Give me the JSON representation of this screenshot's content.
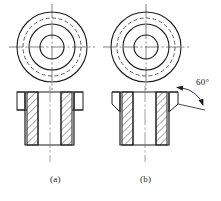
{
  "drawing": {
    "title": "",
    "figure_labels": [
      {
        "id": "a",
        "text": "(a)",
        "x": 50,
        "y": 176
      },
      {
        "id": "b",
        "text": "(b)",
        "x": 140,
        "y": 176
      }
    ],
    "annotations": [
      {
        "id": "chamfer-angle",
        "text": "60°",
        "x": 196,
        "y": 79,
        "belongs_to": "b"
      }
    ],
    "views": [
      {
        "id": "a",
        "top_view": {
          "center": {
            "cx": 52,
            "cy": 47
          },
          "circles": [
            {
              "name": "outer-circle",
              "r": 35,
              "style": "solid"
            },
            {
              "name": "dashed-circle",
              "r": 29,
              "style": "dashed"
            },
            {
              "name": "middle-circle",
              "r": 23,
              "style": "solid"
            },
            {
              "name": "bore-circle",
              "r": 12,
              "style": "solid"
            }
          ],
          "centerlines": {
            "h_half": 43,
            "v_half": 43
          }
        },
        "front_view": {
          "flange": {
            "x1": 17,
            "x2": 83,
            "y1": 92,
            "y2": 110
          },
          "body": {
            "x1": 25,
            "x2": 74,
            "y1": 92,
            "y2": 145
          },
          "bore": {
            "x1": 38,
            "x2": 61
          },
          "chamfered": false,
          "hatch_bands": [
            {
              "x1": 27,
              "x2": 38
            },
            {
              "x1": 61,
              "x2": 72
            }
          ],
          "centerline": {
            "x": 50,
            "y1": 86,
            "y2": 162
          }
        }
      },
      {
        "id": "b",
        "top_view": {
          "center": {
            "cx": 146,
            "cy": 47
          },
          "circles": [
            {
              "name": "outer-circle",
              "r": 35,
              "style": "solid"
            },
            {
              "name": "dashed-circle",
              "r": 29,
              "style": "dashed"
            },
            {
              "name": "middle-circle",
              "r": 23,
              "style": "solid"
            },
            {
              "name": "bore-circle",
              "r": 12,
              "style": "solid"
            }
          ],
          "centerlines": {
            "h_half": 43,
            "v_half": 43
          }
        },
        "front_view": {
          "flange": {
            "x1": 112,
            "x2": 178,
            "y1": 92,
            "y2": 110
          },
          "body": {
            "x1": 120,
            "x2": 169,
            "y1": 92,
            "y2": 145
          },
          "bore": {
            "x1": 133,
            "x2": 156
          },
          "chamfered": true,
          "chamfer_angle_deg": 60,
          "hatch_bands": [
            {
              "x1": 122,
              "x2": 133
            },
            {
              "x1": 156,
              "x2": 167
            }
          ],
          "centerline": {
            "x": 145,
            "y1": 86,
            "y2": 162
          }
        }
      }
    ],
    "colors": {
      "line": "#1d1d1d",
      "thin_line": "#4a4a4a",
      "hatch": "#2a2a2a",
      "background": "#ffffff"
    }
  }
}
